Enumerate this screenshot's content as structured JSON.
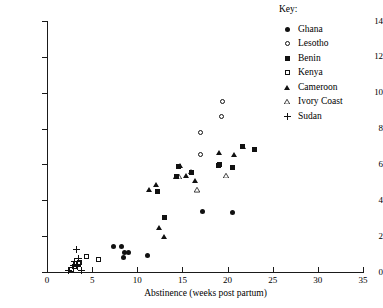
{
  "figure": {
    "title_remnant": "",
    "background": "#ffffff",
    "marker_color": "#111111"
  },
  "legend": {
    "title": "Key:",
    "entries": [
      {
        "label": "Ghana",
        "marker": "filled-circle"
      },
      {
        "label": "Lesotho",
        "marker": "open-circle"
      },
      {
        "label": "Benin",
        "marker": "filled-square"
      },
      {
        "label": "Kenya",
        "marker": "open-square"
      },
      {
        "label": "Cameroon",
        "marker": "filled-triangle"
      },
      {
        "label": "Ivory Coast",
        "marker": "open-triangle"
      },
      {
        "label": "Sudan",
        "marker": "plus"
      }
    ]
  },
  "chart_data": {
    "type": "scatter",
    "title": "",
    "xlabel": "Abstinence (weeks post partum)",
    "ylabel": "Non-susceptible period-Amenorrhoea (weeks post partum)",
    "xlim": [
      0,
      35
    ],
    "ylim": [
      0,
      14
    ],
    "xticks": [
      0,
      5,
      10,
      15,
      20,
      25,
      30,
      35
    ],
    "yticks": [
      0,
      2,
      4,
      6,
      8,
      10,
      12,
      14
    ],
    "grid": false,
    "legend_position": "top-right-outside",
    "series": [
      {
        "name": "Ghana",
        "marker": "filled-circle",
        "points": [
          [
            7.4,
            1.4
          ],
          [
            8.3,
            1.4
          ],
          [
            8.6,
            1.1
          ],
          [
            8.5,
            0.8
          ],
          [
            9.0,
            1.1
          ],
          [
            11.1,
            0.9
          ],
          [
            17.2,
            3.4
          ],
          [
            20.5,
            3.3
          ]
        ]
      },
      {
        "name": "Lesotho",
        "marker": "open-circle",
        "points": [
          [
            17.0,
            6.55
          ],
          [
            17.0,
            7.8
          ],
          [
            19.3,
            8.7
          ],
          [
            19.4,
            9.5
          ]
        ]
      },
      {
        "name": "Benin",
        "marker": "filled-square",
        "points": [
          [
            12.2,
            4.5
          ],
          [
            13.0,
            3.05
          ],
          [
            14.6,
            5.9
          ],
          [
            14.3,
            5.3
          ],
          [
            16.0,
            5.55
          ],
          [
            19.0,
            5.95
          ],
          [
            19.1,
            6.0
          ],
          [
            20.6,
            5.85
          ],
          [
            21.6,
            7.0
          ],
          [
            23.0,
            6.85
          ]
        ]
      },
      {
        "name": "Kenya",
        "marker": "open-square",
        "points": [
          [
            2.7,
            0.15
          ],
          [
            3.1,
            0.3
          ],
          [
            3.5,
            0.45
          ],
          [
            3.6,
            0.55
          ],
          [
            4.4,
            0.85
          ],
          [
            5.7,
            0.7
          ]
        ]
      },
      {
        "name": "Cameroon",
        "marker": "filled-triangle",
        "points": [
          [
            11.3,
            4.6
          ],
          [
            12.1,
            4.85
          ],
          [
            12.4,
            2.45
          ],
          [
            13.0,
            1.95
          ],
          [
            14.7,
            5.9
          ],
          [
            15.4,
            5.35
          ],
          [
            15.9,
            5.55
          ],
          [
            16.4,
            5.1
          ],
          [
            19.0,
            6.65
          ],
          [
            20.7,
            6.5
          ],
          [
            21.7,
            7.0
          ]
        ]
      },
      {
        "name": "Ivory Coast",
        "marker": "open-triangle",
        "points": [
          [
            14.3,
            5.3
          ],
          [
            14.6,
            5.3
          ],
          [
            16.6,
            4.55
          ],
          [
            19.8,
            5.35
          ]
        ]
      },
      {
        "name": "Sudan",
        "marker": "plus",
        "points": [
          [
            2.4,
            0.1
          ],
          [
            2.9,
            0.35
          ],
          [
            3.1,
            0.6
          ],
          [
            3.3,
            1.25
          ],
          [
            3.4,
            0.3
          ],
          [
            3.5,
            0.75
          ],
          [
            3.8,
            0.1
          ]
        ]
      }
    ]
  }
}
